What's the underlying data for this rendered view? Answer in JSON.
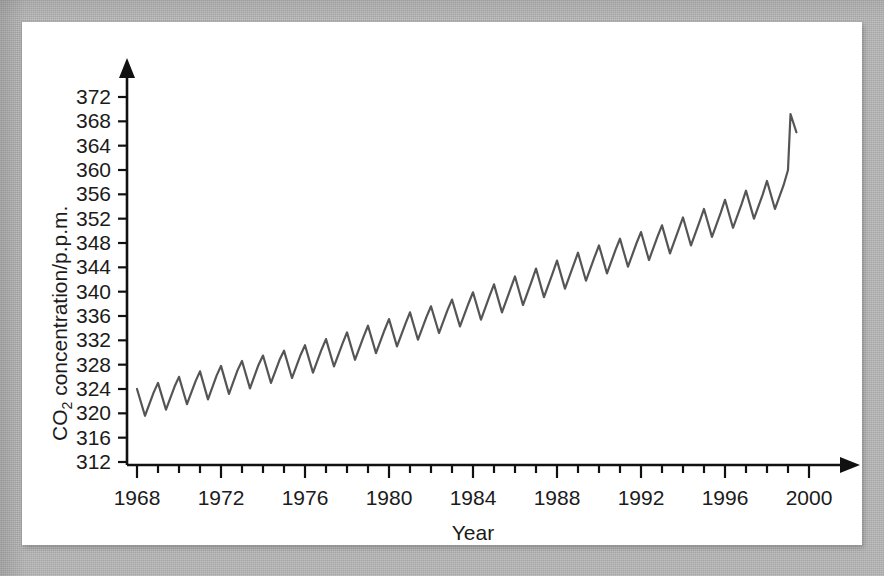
{
  "figure": {
    "panel_bg": "#ffffff",
    "mat_color": "#b3b3b3",
    "axis_color": "#111111",
    "line_color": "#555555"
  },
  "chart_data": {
    "type": "line",
    "title": "",
    "subtitle": "",
    "xlabel": "Year",
    "ylabel": "CO2 concentration/p.p.m.",
    "ylabel_parts": {
      "pre": "CO",
      "sub": "2",
      "post": " concentration/p.p.m."
    },
    "grid": false,
    "legend": null,
    "xlim": [
      1967.0,
      2000.6
    ],
    "ylim": [
      310.0,
      374.0
    ],
    "xticks": [
      1968,
      1972,
      1976,
      1980,
      1984,
      1988,
      1992,
      1996,
      2000
    ],
    "xtick_labels": [
      "1968",
      "1972",
      "1976",
      "1980",
      "1984",
      "1988",
      "1992",
      "1996",
      "2000"
    ],
    "xminor_step": 1,
    "yticks": [
      312,
      316,
      320,
      324,
      328,
      332,
      336,
      340,
      344,
      348,
      352,
      356,
      360,
      364,
      368,
      372
    ],
    "ytick_labels": [
      "312",
      "316",
      "320",
      "324",
      "328",
      "332",
      "336",
      "340",
      "344",
      "348",
      "352",
      "356",
      "360",
      "364",
      "368",
      "372"
    ],
    "axis_arrows": {
      "x": "right",
      "y": "up"
    },
    "series": [
      {
        "name": "Atmospheric CO2 (Mauna Loa)",
        "color": "#555555",
        "linewidth": 2.2,
        "x": [
          1968.0,
          1968.38,
          1968.79,
          1969.0,
          1969.38,
          1969.79,
          1970.0,
          1970.38,
          1970.79,
          1971.0,
          1971.38,
          1971.79,
          1972.0,
          1972.38,
          1972.79,
          1973.0,
          1973.38,
          1973.79,
          1974.0,
          1974.38,
          1974.79,
          1975.0,
          1975.38,
          1975.79,
          1976.0,
          1976.38,
          1976.79,
          1977.0,
          1977.38,
          1977.79,
          1978.0,
          1978.38,
          1978.79,
          1979.0,
          1979.38,
          1979.79,
          1980.0,
          1980.38,
          1980.79,
          1981.0,
          1981.38,
          1981.79,
          1982.0,
          1982.38,
          1982.79,
          1983.0,
          1983.38,
          1983.79,
          1984.0,
          1984.38,
          1984.79,
          1985.0,
          1985.38,
          1985.79,
          1986.0,
          1986.38,
          1986.79,
          1987.0,
          1987.38,
          1987.79,
          1988.0,
          1988.38,
          1988.79,
          1989.0,
          1989.38,
          1989.79,
          1990.0,
          1990.38,
          1990.79,
          1991.0,
          1991.38,
          1991.79,
          1992.0,
          1992.38,
          1992.79,
          1993.0,
          1993.38,
          1993.79,
          1994.0,
          1994.38,
          1994.79,
          1995.0,
          1995.38,
          1995.79,
          1996.0,
          1996.38,
          1996.79,
          1997.0,
          1997.38,
          1997.79,
          1998.0,
          1998.38,
          1998.79,
          1999.0,
          1999.12,
          1999.4
        ],
        "y": [
          324.0,
          319.6,
          323.4,
          325.0,
          320.6,
          324.4,
          326.0,
          321.5,
          325.3,
          326.9,
          322.3,
          326.2,
          327.8,
          323.2,
          327.1,
          328.6,
          324.1,
          328.0,
          329.5,
          325.0,
          328.8,
          330.3,
          325.8,
          329.6,
          331.2,
          326.7,
          330.5,
          332.2,
          327.7,
          331.5,
          333.3,
          328.8,
          332.6,
          334.4,
          329.9,
          333.7,
          335.5,
          331.0,
          334.8,
          336.6,
          332.1,
          335.9,
          337.6,
          333.2,
          337.0,
          338.7,
          334.3,
          338.1,
          339.9,
          335.4,
          339.3,
          341.2,
          336.6,
          340.5,
          342.5,
          337.8,
          341.7,
          343.8,
          339.1,
          343.0,
          345.1,
          340.5,
          344.4,
          346.4,
          341.8,
          345.7,
          347.6,
          343.0,
          346.9,
          348.7,
          344.1,
          348.0,
          349.8,
          345.2,
          349.1,
          350.9,
          346.3,
          350.2,
          352.2,
          347.6,
          351.5,
          353.6,
          349.0,
          352.9,
          355.1,
          350.5,
          354.4,
          356.6,
          352.0,
          355.9,
          358.2,
          353.6,
          357.5,
          360.0,
          369.2,
          366.2
        ]
      }
    ],
    "annotations": []
  }
}
